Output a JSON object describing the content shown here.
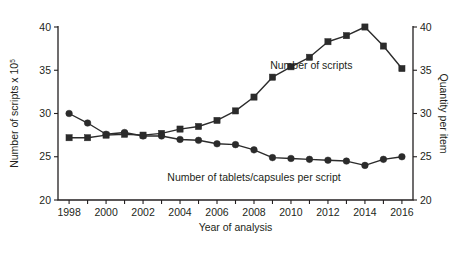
{
  "chart_data": {
    "type": "line",
    "title": "",
    "xlabel": "Year of analysis",
    "ylabel": "Number of scripts x 10",
    "ylabel_superscript": "5",
    "ylabel_right": "Quantity per item",
    "x": [
      1998,
      1999,
      2000,
      2001,
      2002,
      2003,
      2004,
      2005,
      2006,
      2007,
      2008,
      2009,
      2010,
      2011,
      2012,
      2013,
      2014,
      2015,
      2016
    ],
    "xlim": [
      1997.4,
      2016.6
    ],
    "ylim": [
      20,
      40
    ],
    "ylim_right": [
      20,
      40
    ],
    "xticks": [
      1998,
      1999,
      2000,
      2001,
      2002,
      2003,
      2004,
      2005,
      2006,
      2007,
      2008,
      2009,
      2010,
      2011,
      2012,
      2013,
      2014,
      2015,
      2016
    ],
    "xticklabels": [
      "1998",
      "",
      "2000",
      "",
      "2002",
      "",
      "2004",
      "",
      "2006",
      "",
      "2008",
      "",
      "2010",
      "",
      "2012",
      "",
      "2014",
      "",
      "2016"
    ],
    "yticks": [
      20,
      25,
      30,
      35,
      40
    ],
    "yticklabels": [
      "20",
      "25",
      "30",
      "35",
      "40"
    ],
    "yticks_right": [
      20,
      25,
      30,
      35,
      40
    ],
    "yticklabels_right": [
      "20",
      "25",
      "30",
      "35",
      "40"
    ],
    "grid": false,
    "legend_position": "inline-annotations",
    "series": [
      {
        "name": "Number of scripts",
        "marker": "square",
        "axis": "left",
        "annotation": "Number of scripts",
        "values": [
          27.2,
          27.2,
          27.5,
          27.6,
          27.5,
          27.7,
          28.2,
          28.5,
          29.2,
          30.3,
          31.9,
          34.2,
          35.4,
          36.5,
          38.3,
          39.0,
          40.0,
          37.8,
          35.2
        ]
      },
      {
        "name": "Number of tablets/capsules per script",
        "marker": "circle",
        "axis": "right",
        "annotation": "Number of tablets/capsules per script",
        "values": [
          30.0,
          28.9,
          27.6,
          27.8,
          27.4,
          27.4,
          27.0,
          26.9,
          26.5,
          26.4,
          25.8,
          24.9,
          24.8,
          24.7,
          24.6,
          24.5,
          24.0,
          24.7,
          25.0
        ]
      }
    ]
  },
  "annotations": {
    "scripts_label": "Number of scripts",
    "tablets_label": "Number of tablets/capsules per script"
  }
}
